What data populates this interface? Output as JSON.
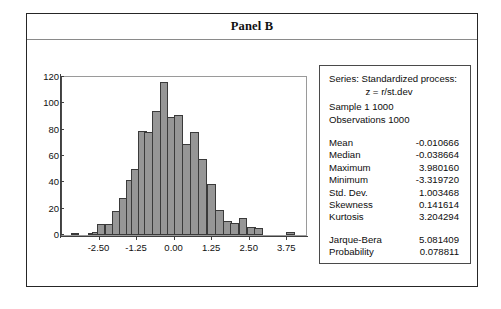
{
  "panel": {
    "title": "Panel B"
  },
  "chart_data": {
    "type": "bar",
    "title": "Panel B",
    "xlabel": "",
    "ylabel": "",
    "grid": false,
    "legend_position": "none",
    "xlim": [
      -3.75,
      4.375
    ],
    "ylim": [
      0,
      120
    ],
    "bin_width": 0.29,
    "x_ticks": [
      "-2.50",
      "-1.25",
      "0.00",
      "1.25",
      "2.50",
      "3.75"
    ],
    "x_tick_values": [
      -2.5,
      -1.25,
      0.0,
      1.25,
      2.5,
      3.75
    ],
    "y_ticks": [
      "0",
      "20",
      "40",
      "60",
      "80",
      "100",
      "120"
    ],
    "y_tick_values": [
      0,
      20,
      40,
      60,
      80,
      100,
      120
    ],
    "bin_centers": [
      -3.25,
      -2.96,
      -2.67,
      -2.38,
      -2.09,
      -1.8,
      -1.51,
      -1.22,
      -0.93,
      -0.64,
      -0.35,
      -0.06,
      0.23,
      0.52,
      0.81,
      1.1,
      1.39,
      1.68,
      1.97,
      2.26,
      2.55,
      2.84,
      3.13,
      3.42,
      3.71,
      4.0
    ],
    "values": [
      1,
      0,
      1,
      2,
      8,
      8,
      18,
      28,
      42,
      50,
      79,
      78,
      94,
      116,
      90,
      91,
      69,
      78,
      58,
      39,
      19,
      11,
      9,
      13,
      6,
      5,
      0,
      2
    ],
    "bars": [
      {
        "center": -3.32,
        "count": 1
      },
      {
        "center": -3.03,
        "count": 0
      },
      {
        "center": -2.74,
        "count": 1
      },
      {
        "center": -2.6,
        "count": 2
      },
      {
        "center": -2.45,
        "count": 8
      },
      {
        "center": -2.16,
        "count": 8
      },
      {
        "center": -1.95,
        "count": 18
      },
      {
        "center": -1.72,
        "count": 28
      },
      {
        "center": -1.49,
        "count": 42
      },
      {
        "center": -1.3,
        "count": 50
      },
      {
        "center": -1.08,
        "count": 79
      },
      {
        "center": -0.86,
        "count": 78
      },
      {
        "center": -0.6,
        "count": 94
      },
      {
        "center": -0.35,
        "count": 116
      },
      {
        "center": -0.1,
        "count": 90
      },
      {
        "center": 0.14,
        "count": 91
      },
      {
        "center": 0.39,
        "count": 69
      },
      {
        "center": 0.66,
        "count": 78
      },
      {
        "center": 0.93,
        "count": 58
      },
      {
        "center": 1.22,
        "count": 39
      },
      {
        "center": 1.5,
        "count": 19
      },
      {
        "center": 1.76,
        "count": 11
      },
      {
        "center": 2.0,
        "count": 9
      },
      {
        "center": 2.28,
        "count": 13
      },
      {
        "center": 2.55,
        "count": 6
      },
      {
        "center": 2.8,
        "count": 5
      },
      {
        "center": 3.4,
        "count": 0
      },
      {
        "center": 3.85,
        "count": 2
      }
    ],
    "series_label": "Standardized process: z = r/st.dev",
    "bar_color": "#969696",
    "bar_edge_color": "#3a3a3a"
  },
  "stats": {
    "series_line1": "Series: Standardized process:",
    "series_line2": "z = r/st.dev",
    "sample": "Sample 1 1000",
    "observations": "Observations 1000",
    "rows": [
      {
        "name": "Mean",
        "value": "-0.010666"
      },
      {
        "name": "Median",
        "value": "-0.038664"
      },
      {
        "name": "Maximum",
        "value": "3.980160"
      },
      {
        "name": "Minimum",
        "value": "-3.319720"
      },
      {
        "name": "Std. Dev.",
        "value": "1.003468"
      },
      {
        "name": "Skewness",
        "value": "0.141614"
      },
      {
        "name": "Kurtosis",
        "value": "3.204294"
      }
    ],
    "test_rows": [
      {
        "name": "Jarque-Bera",
        "value": "5.081409"
      },
      {
        "name": "Probability",
        "value": "0.078811"
      }
    ]
  }
}
